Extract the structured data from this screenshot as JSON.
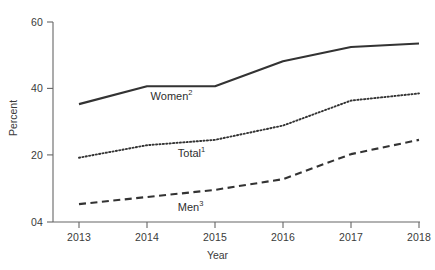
{
  "chart_data": {
    "type": "line",
    "title": "",
    "subtitle": "",
    "xlabel": "Year",
    "ylabel": "Percent",
    "x": [
      2013,
      2014,
      2015,
      2016,
      2017,
      2018
    ],
    "xtick_labels": [
      "2013",
      "2014",
      "2015",
      "2016",
      "2017",
      "2018"
    ],
    "ytick_labels": [
      "04",
      "20",
      "40",
      "60"
    ],
    "ytick_values": [
      4,
      20,
      40,
      60
    ],
    "ylim": [
      4,
      60
    ],
    "xlim": [
      2013,
      2018
    ],
    "grid": false,
    "legend_position": "inline-annotations",
    "series": [
      {
        "name": "Women",
        "footnote": "2",
        "label_text": "Women",
        "style": "solid",
        "color": "#333333",
        "values": [
          37,
          42,
          42,
          49,
          53,
          54
        ]
      },
      {
        "name": "Total",
        "footnote": "1",
        "label_text": "Total",
        "style": "dotted",
        "color": "#333333",
        "values": [
          22,
          25.5,
          27,
          31,
          38,
          40
        ]
      },
      {
        "name": "Men",
        "footnote": "3",
        "label_text": "Men",
        "style": "dashed",
        "color": "#333333",
        "values": [
          9,
          11,
          13,
          16,
          23,
          27
        ]
      }
    ],
    "annotations": [
      {
        "text": "Women",
        "footnote": "2",
        "x": 2014.2,
        "y": 39.0
      },
      {
        "text": "Total",
        "footnote": "1",
        "x": 2014.6,
        "y": 23.0
      },
      {
        "text": "Men",
        "footnote": "3",
        "x": 2014.6,
        "y": 8.0
      }
    ]
  },
  "axis": {
    "y_title": "Percent",
    "x_title": "Year"
  }
}
